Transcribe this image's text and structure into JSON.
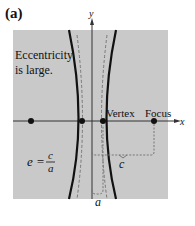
{
  "panel_label": "(a)",
  "axes": {
    "x_label": "x",
    "y_label": "y"
  },
  "annotations": {
    "eccentricity_line1": "Eccentricity",
    "eccentricity_line2": "is large.",
    "vertex": "Vertex",
    "focus": "Focus",
    "c_label": "c",
    "a_label": "a",
    "formula_lhs": "e =",
    "formula_num": "c",
    "formula_den": "a"
  },
  "colors": {
    "background": "#c9c9c9",
    "curve": "#111111",
    "dashed": "#777777"
  }
}
